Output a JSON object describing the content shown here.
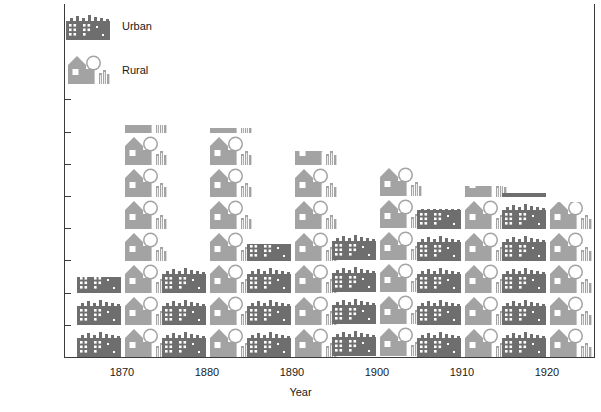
{
  "chart_data": {
    "type": "bar",
    "title": "",
    "xlabel": "Year",
    "ylabel": "Percentage of U.S. Population",
    "categories": [
      "1870",
      "1880",
      "1890",
      "1900",
      "1910",
      "1920"
    ],
    "series": [
      {
        "name": "Urban",
        "color": "#6e6e6e",
        "values": [
          25,
          28,
          35,
          40,
          46,
          51
        ]
      },
      {
        "name": "Rural",
        "color": "#a3a3a3",
        "values": [
          72,
          71,
          64,
          60,
          53,
          48
        ]
      }
    ],
    "ylim": [
      0,
      85
    ],
    "yticks": [
      10,
      20,
      30,
      40,
      50,
      60,
      70,
      80
    ],
    "ytick_labels": [
      "10",
      "20",
      "30",
      "40",
      "50",
      "60",
      "70",
      "80"
    ],
    "grid": false,
    "legend_position": "top-left",
    "units_per_icon": 10,
    "icon_names": [
      "urban-city-icon",
      "rural-house-icon"
    ]
  },
  "legend": {
    "items": [
      {
        "label": "Urban",
        "icon": "urban-city-icon",
        "color": "#6e6e6e"
      },
      {
        "label": "Rural",
        "icon": "rural-house-icon",
        "color": "#a3a3a3"
      }
    ]
  },
  "axes": {
    "y_title": "Percentage of U.S. Population",
    "x_title": "Year",
    "y_ticks": [
      "80",
      "70",
      "60",
      "50",
      "40",
      "30",
      "20",
      "10"
    ],
    "x_ticks": [
      "1870",
      "1880",
      "1890",
      "1900",
      "1910",
      "1920"
    ]
  },
  "colors": {
    "urban": "#6e6e6e",
    "rural": "#a3a3a3",
    "axis": "#3b3b3b",
    "text": "#1a1a1a",
    "background": "#ffffff"
  }
}
